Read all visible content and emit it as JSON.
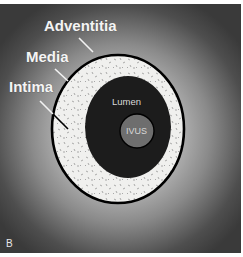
{
  "figure": {
    "panel_letter": "B"
  },
  "labels": {
    "adventitia": "Adventitia",
    "media": "Media",
    "intima": "Intima",
    "lumen": "Lumen",
    "ivus": "IVUS"
  },
  "colors": {
    "background_center": "#e2e2e2",
    "background_edge": "#3a3a3a",
    "vessel_wall": "#f0f0ee",
    "lumen": "#1c1c1c",
    "ivus_catheter": "#6e6e6e",
    "outline": "#000000",
    "label_text": "#f4f4f4"
  }
}
